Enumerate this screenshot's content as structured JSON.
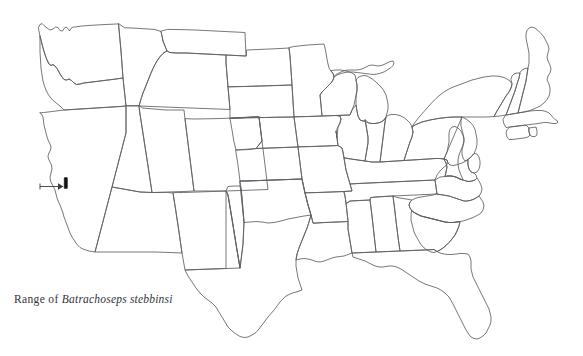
{
  "figure": {
    "kind": "range-map",
    "region": "contiguous United States",
    "background_color": "#ffffff",
    "outline_color": "#5e5e66",
    "marker_color": "#141418",
    "pointer_color": "#3a3a42",
    "width": 583,
    "height": 356
  },
  "running_header": {
    "text": "",
    "color": "#d8d8dc",
    "note": "cut-off page header at very top edge, illegible"
  },
  "caption": {
    "lead_in": "Range of ",
    "species": "Batrachoseps stebbinsi",
    "full_text": "Range of Batrachoseps stebbinsi",
    "color": "#33333a"
  },
  "range": {
    "marker_label": "range-marker",
    "location_description": "southern Sierra Nevada, California",
    "marker_x": 65,
    "marker_y": 183,
    "marker_width": 3.2,
    "marker_height": 11
  },
  "pointer": {
    "label": "range-pointer-arrow",
    "start_x": 40,
    "start_y": 186,
    "end_x": 61,
    "end_y": 186
  }
}
